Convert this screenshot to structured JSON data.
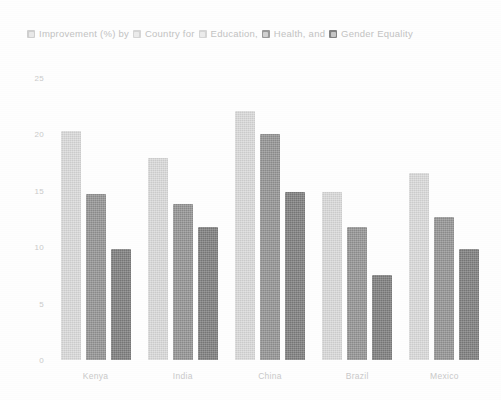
{
  "chart_data": {
    "type": "bar",
    "title": "Improvement (%) by Country for Education, Health, and Gender Equality",
    "title_line_1": "Improvement (%) by Country for Education, Health, and",
    "title_line_2": "Gender Equality",
    "title_parts": {
      "p1": "Improvement (%) by",
      "p2": "Country for",
      "p3": "Education,",
      "p4": "Health, and",
      "p5": "Gender Equality"
    },
    "categories": [
      "Kenya",
      "India",
      "China",
      "Brazil",
      "Mexico"
    ],
    "series": [
      {
        "name": "Education",
        "color": "#dcdcdc",
        "values": [
          20.3,
          17.9,
          22.1,
          14.9,
          16.6
        ]
      },
      {
        "name": "Health",
        "color": "#949494",
        "values": [
          14.7,
          13.8,
          20.0,
          11.8,
          12.7
        ]
      },
      {
        "name": "Gender Equality",
        "color": "#7e7e7e",
        "values": [
          9.8,
          11.8,
          14.9,
          7.5,
          9.8
        ]
      }
    ],
    "xlabel": "",
    "ylabel": "",
    "ylim": [
      0,
      25
    ],
    "yticks": [
      25,
      20,
      15,
      10,
      5,
      0
    ],
    "ytick_labels": [
      "25",
      "20",
      "15",
      "10",
      "5",
      "0"
    ],
    "grid": false,
    "legend_position": "top"
  },
  "style": {
    "background": "#ffffff",
    "text_color": "#c2c2c2",
    "axis_label_color": "#cacaca"
  }
}
